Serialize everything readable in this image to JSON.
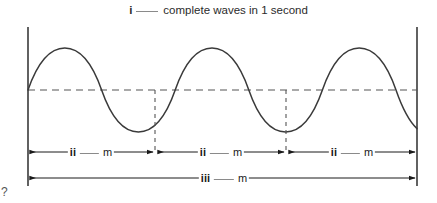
{
  "figure": {
    "title": {
      "roman": "i",
      "blank": "___",
      "text": "complete waves in 1 second"
    },
    "wave": {
      "cycles": 3,
      "baseline_y": 90,
      "amplitude_px": 42,
      "left_axis_x": 28,
      "right_axis_x": 417,
      "stroke_color": "#3a3a3a",
      "baseline_color": "#555555"
    },
    "segment_labels": [
      {
        "roman": "ii",
        "blank": "___",
        "unit": "m"
      },
      {
        "roman": "ii",
        "blank": "___",
        "unit": "m"
      },
      {
        "roman": "ii",
        "blank": "___",
        "unit": "m"
      }
    ],
    "total_label": {
      "roman": "iii",
      "blank": "___",
      "unit": "m"
    },
    "corner_glyph": "?"
  }
}
